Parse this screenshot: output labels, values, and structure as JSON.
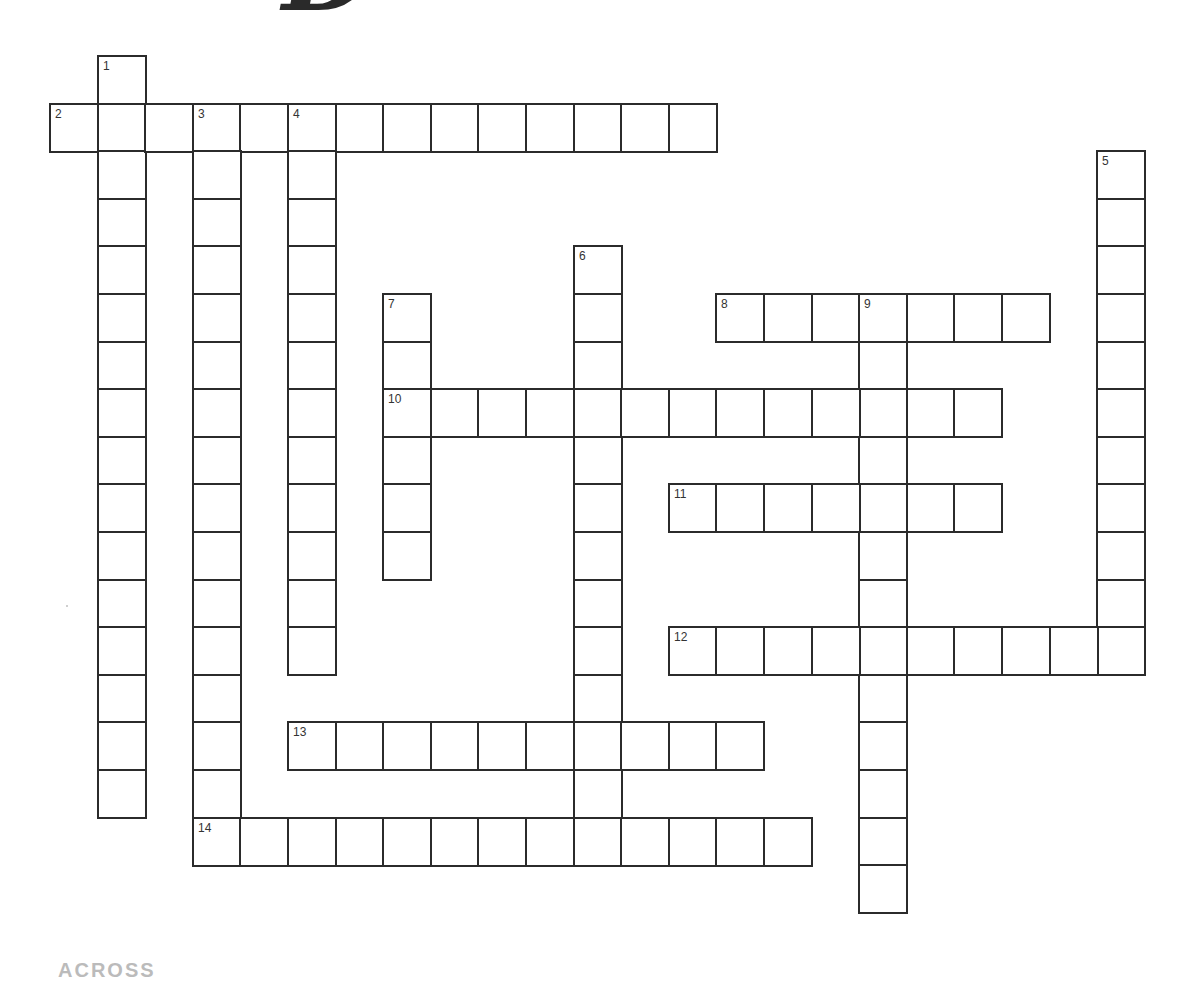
{
  "puzzle": {
    "title_visible_fragment": "D",
    "section_heading": "ACROSS",
    "grid_geometry": {
      "origin_x": 49,
      "origin_y": 55,
      "cell_size": 47.6
    },
    "entries": [
      {
        "number": 1,
        "direction": "down",
        "row": 0,
        "col": 1,
        "length": 16
      },
      {
        "number": 2,
        "direction": "across",
        "row": 1,
        "col": 0,
        "length": 14
      },
      {
        "number": 3,
        "direction": "down",
        "row": 1,
        "col": 3,
        "length": 16
      },
      {
        "number": 4,
        "direction": "down",
        "row": 1,
        "col": 5,
        "length": 12
      },
      {
        "number": 5,
        "direction": "down",
        "row": 2,
        "col": 22,
        "length": 11
      },
      {
        "number": 6,
        "direction": "down",
        "row": 4,
        "col": 11,
        "length": 13
      },
      {
        "number": 7,
        "direction": "down",
        "row": 5,
        "col": 7,
        "length": 6
      },
      {
        "number": 8,
        "direction": "across",
        "row": 5,
        "col": 14,
        "length": 7
      },
      {
        "number": 9,
        "direction": "down",
        "row": 5,
        "col": 17,
        "length": 13
      },
      {
        "number": 10,
        "direction": "across",
        "row": 7,
        "col": 7,
        "length": 13
      },
      {
        "number": 11,
        "direction": "across",
        "row": 9,
        "col": 13,
        "length": 7
      },
      {
        "number": 12,
        "direction": "across",
        "row": 12,
        "col": 13,
        "length": 10
      },
      {
        "number": 13,
        "direction": "across",
        "row": 14,
        "col": 5,
        "length": 10
      },
      {
        "number": 14,
        "direction": "across",
        "row": 16,
        "col": 3,
        "length": 13
      }
    ],
    "colors": {
      "line": "#2b2b2b",
      "background": "#ffffff",
      "number_text": "#333333"
    }
  }
}
